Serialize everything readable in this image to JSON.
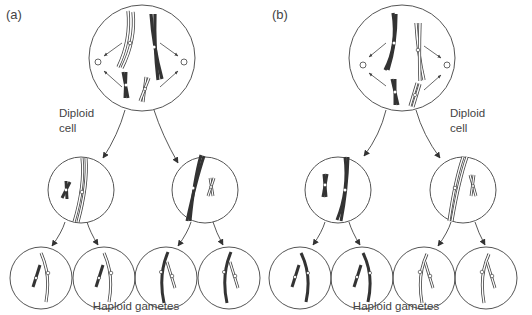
{
  "panels": [
    {
      "id": "a",
      "label": "(a)",
      "parent_label_line1": "Diploid",
      "parent_label_line2": "cell",
      "gametes_label": "Haploid gametes"
    },
    {
      "id": "b",
      "label": "(b)",
      "parent_label_line1": "Diploid",
      "parent_label_line2": "cell",
      "gametes_label": "Haploid gametes"
    }
  ],
  "colors": {
    "outline": "#555555",
    "dark_chromosome": "#333333",
    "light_chromosome_fill": "#ffffff",
    "background": "#ffffff"
  },
  "diagram": {
    "stages": [
      "Diploid cell",
      "Meiosis I daughter cells",
      "Haploid gametes"
    ],
    "cells_per_panel": {
      "parent": 1,
      "intermediate": 2,
      "gametes": 4
    }
  }
}
